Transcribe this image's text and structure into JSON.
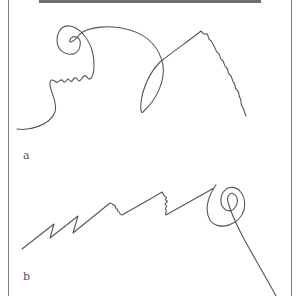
{
  "figure": {
    "panels": [
      {
        "id": "a",
        "label": "a",
        "description": "freehand line with loops and wavy segments"
      },
      {
        "id": "b",
        "label": "b",
        "description": "zigzag line with wavy segments ending in spiral and tail"
      }
    ],
    "colors": {
      "line": "#555555",
      "frame": "#7a7a7a",
      "topbar": "#6e6e6e",
      "background": "#ffffff"
    }
  }
}
